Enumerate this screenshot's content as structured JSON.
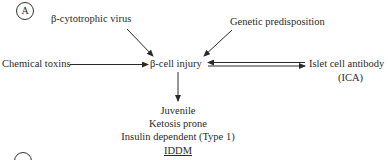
{
  "panel_labels": {
    "a": "A",
    "b": "B"
  },
  "nodes": {
    "virus": "β-cytotrophic virus",
    "genetic": "Genetic predisposition",
    "chemical": "Chemical toxins",
    "injury": "β-cell injury",
    "ica_line1": "Islet cell antibody",
    "ica_line2": "(ICA)"
  },
  "outcome": {
    "line1": "Juvenile",
    "line2": "Ketosis prone",
    "line3": "Insulin dependent (Type 1)",
    "line4": "IDDM"
  },
  "edges": [
    {
      "from": "β-cytotrophic virus",
      "to": "β-cell injury"
    },
    {
      "from": "Genetic predisposition",
      "to": "β-cell injury"
    },
    {
      "from": "Chemical toxins",
      "to": "β-cell injury"
    },
    {
      "from": "β-cell injury",
      "to": "Islet cell antibody (ICA)"
    },
    {
      "from": "Islet cell antibody (ICA)",
      "to": "β-cell injury"
    },
    {
      "from": "β-cell injury",
      "to": "Juvenile / Ketosis prone / Insulin dependent (Type 1) / IDDM"
    }
  ]
}
